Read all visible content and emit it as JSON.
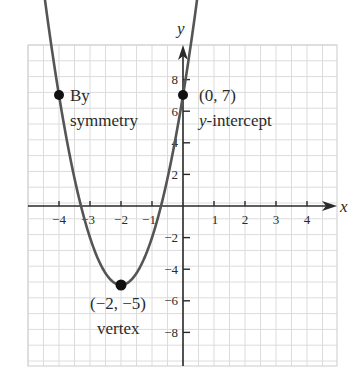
{
  "chart_data": {
    "type": "line",
    "title": "",
    "function": "y = 3x^2 + 12x + 7",
    "xlabel": "x",
    "ylabel": "y",
    "xlim": [
      -5,
      5
    ],
    "ylim": [
      -10,
      10
    ],
    "grid": true,
    "x_ticks": [
      -4,
      -3,
      -2,
      -1,
      1,
      2,
      3,
      4
    ],
    "y_ticks": [
      -8,
      -6,
      -4,
      -2,
      2,
      4,
      6,
      8
    ],
    "x_tick_labels": [
      "−4",
      "−3",
      "−2",
      "−1",
      "1",
      "2",
      "3",
      "4"
    ],
    "y_tick_labels": [
      "−8",
      "−6",
      "−4",
      "−2",
      "2",
      "4",
      "6",
      "8"
    ],
    "series": [
      {
        "name": "parabola",
        "x": [
          -4.77,
          -4,
          -3,
          -2,
          -1,
          0,
          0.77
        ],
        "y": [
          10,
          7,
          -2,
          -5,
          -2,
          7,
          10
        ]
      }
    ],
    "points": [
      {
        "x": -4,
        "y": 7,
        "label_line1": "By",
        "label_line2": "symmetry"
      },
      {
        "x": 0,
        "y": 7,
        "label_line1": "(0, 7)",
        "label_line2": "y-intercept"
      },
      {
        "x": -2,
        "y": -5,
        "label_line1": "(−2, −5)",
        "label_line2": "vertex"
      }
    ],
    "colors": {
      "curve": "#555555",
      "axes": "#2a2a2a",
      "grid": "#d8d8d8",
      "point": "#111111"
    }
  },
  "labels": {
    "x_axis": "x",
    "y_axis": "y",
    "symmetry_1": "By",
    "symmetry_2": "symmetry",
    "intercept_1": "(0, 7)",
    "intercept_2": "y-intercept",
    "vertex_1": "(−2, −5)",
    "vertex_2": "vertex",
    "xt": [
      "−4",
      "−3",
      "−2",
      "−1",
      "1",
      "2",
      "3",
      "4"
    ],
    "yt": [
      "8",
      "6",
      "4",
      "2",
      "−2",
      "−4",
      "−6",
      "−8"
    ]
  }
}
